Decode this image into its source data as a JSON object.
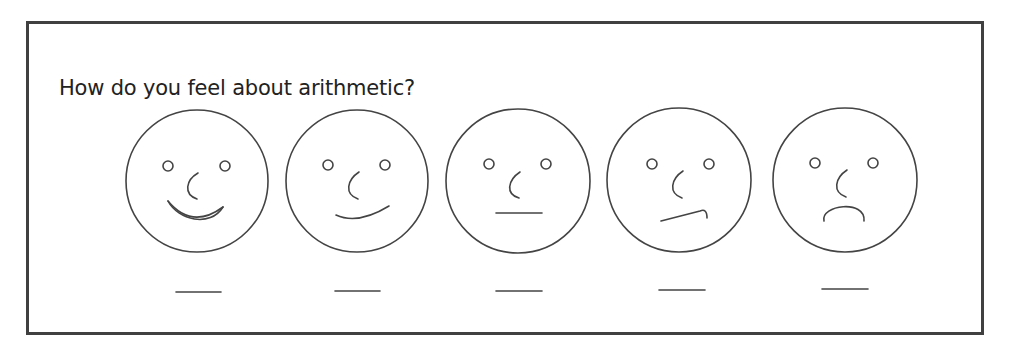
{
  "question": {
    "text": "How do you feel about arithmetic?"
  },
  "scale": {
    "options": [
      {
        "id": "very-happy",
        "expression": "big-smile",
        "answer_blank": ""
      },
      {
        "id": "happy",
        "expression": "smile",
        "answer_blank": ""
      },
      {
        "id": "neutral",
        "expression": "straight-mouth",
        "answer_blank": ""
      },
      {
        "id": "unsure",
        "expression": "crooked-mouth",
        "answer_blank": ""
      },
      {
        "id": "sad",
        "expression": "frown",
        "answer_blank": ""
      }
    ]
  },
  "colors": {
    "frame_border": "#404040",
    "line": "#444444",
    "text": "#222222"
  }
}
